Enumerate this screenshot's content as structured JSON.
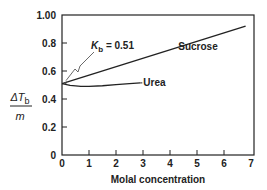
{
  "chart_data": {
    "type": "line",
    "title": "",
    "xlabel": "Molal concentration",
    "ylabel_numerator": "ΔT",
    "ylabel_subscript": "b",
    "ylabel_denominator": "m",
    "xlim": [
      0,
      7
    ],
    "ylim": [
      0,
      1.0
    ],
    "x_ticks": [
      0,
      1,
      2,
      3,
      4,
      5,
      6,
      7
    ],
    "x_tick_labels": [
      "0",
      "1",
      "2",
      "3",
      "4",
      "5",
      "6",
      "7"
    ],
    "y_ticks": [
      0,
      0.2,
      0.4,
      0.6,
      0.8,
      1.0
    ],
    "y_tick_labels": [
      "0",
      "0.2",
      "0.4",
      "0.6",
      "0.8",
      "1.00"
    ],
    "grid": false,
    "series": [
      {
        "name": "Sucrose",
        "x": [
          0,
          6.8
        ],
        "y": [
          0.51,
          0.92
        ]
      },
      {
        "name": "Urea",
        "x": [
          0,
          0.3,
          0.7,
          1.0,
          1.5,
          2.0,
          2.5,
          2.9
        ],
        "y": [
          0.51,
          0.497,
          0.49,
          0.49,
          0.495,
          0.503,
          0.51,
          0.515
        ]
      }
    ],
    "annotations": [
      {
        "text_main": "K",
        "text_sub": "b",
        "text_rest": " = 0.51",
        "points_to": [
          0,
          0.51
        ]
      }
    ]
  }
}
